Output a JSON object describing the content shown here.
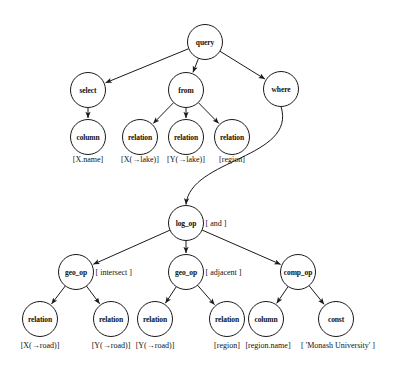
{
  "diagram": {
    "colors": {
      "stroke": "#1a1a1a",
      "fill": "#ffffff",
      "text": "#111111"
    },
    "nodes": [
      {
        "id": "query",
        "label": "query",
        "cx": 205,
        "cy": 42,
        "r": 17.5,
        "annotation": ""
      },
      {
        "id": "select",
        "label": "select",
        "cx": 88,
        "cy": 90,
        "r": 17.5,
        "annotation": ""
      },
      {
        "id": "from",
        "label": "from",
        "cx": 186,
        "cy": 90,
        "r": 17.5,
        "annotation": ""
      },
      {
        "id": "where",
        "label": "where",
        "cx": 281,
        "cy": 89,
        "r": 17.5,
        "annotation": ""
      },
      {
        "id": "column1",
        "label": "column",
        "cx": 88,
        "cy": 137,
        "r": 17.5,
        "annotation": ""
      },
      {
        "id": "rel1",
        "label": "relation",
        "cx": 140,
        "cy": 137,
        "r": 17.5,
        "annotation": ""
      },
      {
        "id": "rel2",
        "label": "relation",
        "cx": 186,
        "cy": 137,
        "r": 17.5,
        "annotation": ""
      },
      {
        "id": "rel3",
        "label": "relation",
        "cx": 232,
        "cy": 137,
        "r": 17.5,
        "annotation": ""
      },
      {
        "id": "logop",
        "label": "log_op",
        "cx": 186,
        "cy": 223,
        "r": 17.5,
        "annotation": "[ and ]"
      },
      {
        "id": "geoop1",
        "label": "geo_op",
        "cx": 76,
        "cy": 272,
        "r": 17.5,
        "annotation": "[ intersect ]"
      },
      {
        "id": "geoop2",
        "label": "geo_op",
        "cx": 186,
        "cy": 272,
        "r": 17.5,
        "annotation": "[ adjacent ]"
      },
      {
        "id": "compop",
        "label": "comp_op",
        "cx": 298,
        "cy": 272,
        "r": 17.5,
        "annotation": ""
      },
      {
        "id": "rel4",
        "label": "relation",
        "cx": 40,
        "cy": 319,
        "r": 17.5,
        "annotation": ""
      },
      {
        "id": "rel5",
        "label": "relation",
        "cx": 111,
        "cy": 319,
        "r": 17.5,
        "annotation": ""
      },
      {
        "id": "rel6",
        "label": "relation",
        "cx": 155,
        "cy": 319,
        "r": 17.5,
        "annotation": ""
      },
      {
        "id": "rel7",
        "label": "relation",
        "cx": 227,
        "cy": 319,
        "r": 17.5,
        "annotation": ""
      },
      {
        "id": "column2",
        "label": "column",
        "cx": 266,
        "cy": 319,
        "r": 17.5,
        "annotation": ""
      },
      {
        "id": "const1",
        "label": "const",
        "cx": 336,
        "cy": 319,
        "r": 17.5,
        "annotation": ""
      }
    ],
    "leaf_labels": [
      {
        "id": "lbl-x-name",
        "text": "[X.name]",
        "x": 88,
        "y": 159
      },
      {
        "id": "lbl-x-lake",
        "text": "[X(→lake)]",
        "x": 140,
        "y": 159
      },
      {
        "id": "lbl-y-lake",
        "text": "[Y(→lake)]",
        "x": 186,
        "y": 159
      },
      {
        "id": "lbl-region-1",
        "text": "[region]",
        "x": 232,
        "y": 159
      },
      {
        "id": "lbl-x-road",
        "text": "[X(→road)]",
        "x": 40,
        "y": 345
      },
      {
        "id": "lbl-y-road-1",
        "text": "[Y(→road)]",
        "x": 111,
        "y": 345
      },
      {
        "id": "lbl-y-road-2",
        "text": "[Y(→road)]",
        "x": 155,
        "y": 345
      },
      {
        "id": "lbl-region-2",
        "text": "[region]",
        "x": 227,
        "y": 345
      },
      {
        "id": "lbl-region-name",
        "text": "[region.name]",
        "x": 268,
        "y": 345
      },
      {
        "id": "lbl-monash",
        "text": "[ 'Monash University' ]",
        "x": 338,
        "y": 345
      }
    ],
    "edges": [
      {
        "from": "query",
        "to": "select",
        "type": "line"
      },
      {
        "from": "query",
        "to": "from",
        "type": "line"
      },
      {
        "from": "query",
        "to": "where",
        "type": "line"
      },
      {
        "from": "select",
        "to": "column1",
        "type": "line"
      },
      {
        "from": "from",
        "to": "rel1",
        "type": "line"
      },
      {
        "from": "from",
        "to": "rel2",
        "type": "line"
      },
      {
        "from": "from",
        "to": "rel3",
        "type": "line"
      },
      {
        "from": "where",
        "to": "logop",
        "type": "curve"
      },
      {
        "from": "logop",
        "to": "geoop1",
        "type": "line"
      },
      {
        "from": "logop",
        "to": "geoop2",
        "type": "line"
      },
      {
        "from": "logop",
        "to": "compop",
        "type": "line"
      },
      {
        "from": "geoop1",
        "to": "rel4",
        "type": "line"
      },
      {
        "from": "geoop1",
        "to": "rel5",
        "type": "line"
      },
      {
        "from": "geoop2",
        "to": "rel6",
        "type": "line"
      },
      {
        "from": "geoop2",
        "to": "rel7",
        "type": "line"
      },
      {
        "from": "compop",
        "to": "column2",
        "type": "line"
      },
      {
        "from": "compop",
        "to": "const1",
        "type": "line"
      }
    ]
  }
}
